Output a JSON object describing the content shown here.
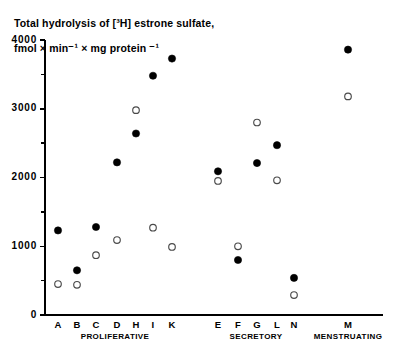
{
  "figure": {
    "title_line_1": "Total hydrolysis of [³H] estrone sulfate,",
    "title_line_2": "fmol × min⁻¹ × mg protein ⁻¹",
    "background_color": "#ffffff",
    "ink_color": "#000000"
  },
  "chart_data": {
    "type": "scatter",
    "title": "Total hydrolysis of [³H] estrone sulfate, fmol × min⁻¹ × mg protein ⁻¹",
    "xlabel": "",
    "ylabel": "Total hydrolysis of [³H] estrone sulfate, fmol × min⁻¹ × mg protein ⁻¹",
    "ylim": [
      0,
      4000
    ],
    "grid": false,
    "legend_position": "none",
    "y_major_ticks": [
      0,
      1000,
      2000,
      3000,
      4000
    ],
    "y_major_tick_labels": [
      "0",
      "1000",
      "2000",
      "3000",
      "4000"
    ],
    "y_minor_ticks": [
      500,
      1500,
      2500,
      3500
    ],
    "categories": [
      "A",
      "B",
      "C",
      "D",
      "H",
      "I",
      "K",
      "E",
      "F",
      "G",
      "L",
      "N",
      "M"
    ],
    "groups": [
      {
        "label": "PROLIFERATIVE",
        "categories": [
          "A",
          "B",
          "C",
          "D",
          "H",
          "I",
          "K"
        ]
      },
      {
        "label": "SECRETORY",
        "categories": [
          "E",
          "F",
          "G",
          "L",
          "N"
        ]
      },
      {
        "label": "MENSTRUATING",
        "categories": [
          "M"
        ]
      }
    ],
    "series": [
      {
        "name": "filled-circle",
        "marker": "filled circle",
        "color": "#000000",
        "values": [
          1230,
          650,
          1280,
          2220,
          2640,
          3480,
          3730,
          2090,
          800,
          2210,
          2470,
          540,
          3860
        ]
      },
      {
        "name": "open-circle",
        "marker": "open circle",
        "color": "#ffffff",
        "values": [
          450,
          440,
          870,
          1090,
          2980,
          1270,
          990,
          1950,
          1000,
          2800,
          1960,
          290,
          3180
        ]
      }
    ],
    "points": [
      {
        "category": "A",
        "x_px": 58,
        "filled": 1230,
        "open": 450
      },
      {
        "category": "B",
        "x_px": 77,
        "filled": 650,
        "open": 440
      },
      {
        "category": "C",
        "x_px": 96,
        "filled": 1280,
        "open": 870
      },
      {
        "category": "D",
        "x_px": 117,
        "filled": 2220,
        "open": 1090
      },
      {
        "category": "H",
        "x_px": 136,
        "filled": 2640,
        "open": 2980
      },
      {
        "category": "I",
        "x_px": 153,
        "filled": 3480,
        "open": 1270
      },
      {
        "category": "K",
        "x_px": 172,
        "filled": 3730,
        "open": 990
      },
      {
        "category": "E",
        "x_px": 218,
        "filled": 2090,
        "open": 1950
      },
      {
        "category": "F",
        "x_px": 238,
        "filled": 800,
        "open": 1000
      },
      {
        "category": "G",
        "x_px": 257,
        "filled": 2210,
        "open": 2800
      },
      {
        "category": "L",
        "x_px": 277,
        "filled": 2470,
        "open": 1960
      },
      {
        "category": "N",
        "x_px": 294,
        "filled": 540,
        "open": 290
      },
      {
        "category": "M",
        "x_px": 348,
        "filled": 3860,
        "open": 3180
      }
    ]
  }
}
